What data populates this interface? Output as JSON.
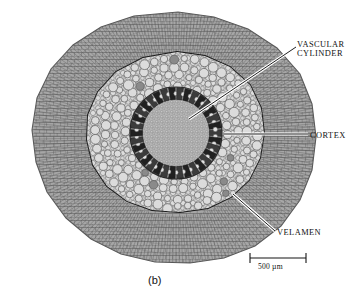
{
  "figure": {
    "panel_label": "(b)",
    "background_color": "#ffffff"
  },
  "annotations": [
    {
      "id": "vascular-cylinder",
      "line1": "VASCULAR",
      "line2": "CYLINDER",
      "leader": "diagonal",
      "color": "#111111"
    },
    {
      "id": "cortex",
      "line1": "CORTEX",
      "line2": "",
      "leader": "horizontal",
      "color": "#111111"
    },
    {
      "id": "velamen",
      "line1": "VELAMEN",
      "line2": "",
      "leader": "diagonal",
      "color": "#111111"
    }
  ],
  "scale_bar": {
    "label": "500 µm",
    "length_px": 56,
    "value": 500,
    "unit": "µm"
  },
  "tissues": {
    "velamen": {
      "name": "velamen",
      "tone": "#9b9b9b"
    },
    "cortex": {
      "name": "cortex",
      "tone": "#c9c9c9"
    },
    "vascular_cylinder": {
      "name": "vascular cylinder",
      "tone": "#555555"
    },
    "pith": {
      "name": "pith",
      "tone": "#a8a8a8"
    }
  }
}
